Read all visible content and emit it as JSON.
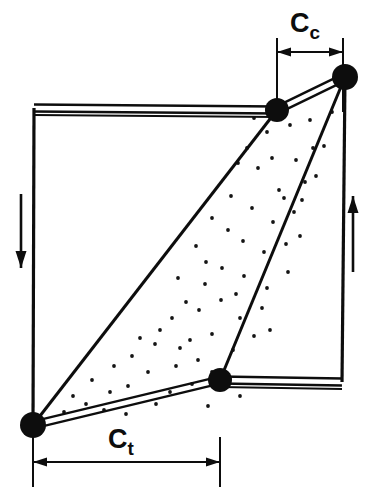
{
  "diagram": {
    "colors": {
      "ink": "#0d0d0d",
      "background": "#ffffff",
      "stipple": "#141414"
    },
    "labels": {
      "compression": {
        "base": "C",
        "subscript": "c",
        "full": "Cc"
      },
      "tension": {
        "base": "C",
        "subscript": "t",
        "full": "Ct"
      }
    },
    "dimensions": [
      {
        "name": "compression-width",
        "label_base": "C",
        "label_sub": "c",
        "x_start": 277,
        "x_end": 343,
        "line_y": 52,
        "ext_top": 38,
        "ext_bottom": 112,
        "label_x": 305,
        "label_y": 32
      },
      {
        "name": "tension-width",
        "label_base": "C",
        "label_sub": "t",
        "x_start": 33,
        "x_end": 220,
        "line_y": 462,
        "ext_top": 437,
        "ext_bottom": 487,
        "label_x": 121,
        "label_y": 448
      }
    ],
    "frame": {
      "name": "undeformed-frame",
      "top_left": {
        "x": 34,
        "y": 108
      },
      "top_right": {
        "x": 345,
        "y": 77
      },
      "bottom_right": {
        "x": 342,
        "y": 382
      },
      "bottom_left": {
        "x": 33,
        "y": 425
      },
      "stroke_width": 3
    },
    "nodes": [
      {
        "name": "node-top-left",
        "x": 277,
        "y": 110,
        "r": 12
      },
      {
        "name": "node-top-right",
        "x": 345,
        "y": 77,
        "r": 13
      },
      {
        "name": "node-bottom-right",
        "x": 220,
        "y": 380,
        "r": 12
      },
      {
        "name": "node-bottom-left",
        "x": 33,
        "y": 425,
        "r": 13
      }
    ],
    "chords": [
      {
        "name": "top-chord",
        "x1": 34,
        "y1": 108,
        "x2": 277,
        "y2": 110
      },
      {
        "name": "bottom-chord",
        "x1": 220,
        "y1": 380,
        "x2": 342,
        "y2": 382
      },
      {
        "name": "top-strut-link",
        "x1": 277,
        "y1": 110,
        "x2": 345,
        "y2": 77
      },
      {
        "name": "bottom-strut-link",
        "x1": 33,
        "y1": 425,
        "x2": 220,
        "y2": 380
      }
    ],
    "strut": {
      "name": "diagonal-strut-region",
      "points": "33,425 277,110 345,77 220,380",
      "fill_pattern": "stipple-dots"
    },
    "shear_arrows": [
      {
        "name": "shear-arrow-left",
        "direction": "down",
        "x": 21,
        "y_start": 194,
        "y_end": 268
      },
      {
        "name": "shear-arrow-right",
        "direction": "up",
        "x": 353,
        "y_start": 272,
        "y_end": 196
      }
    ],
    "stipple_dots": [
      [
        267,
        132
      ],
      [
        290,
        125
      ],
      [
        313,
        148
      ],
      [
        296,
        160
      ],
      [
        258,
        168
      ],
      [
        279,
        190
      ],
      [
        238,
        163
      ],
      [
        305,
        182
      ],
      [
        324,
        146
      ],
      [
        231,
        196
      ],
      [
        252,
        208
      ],
      [
        273,
        222
      ],
      [
        294,
        212
      ],
      [
        212,
        218
      ],
      [
        316,
        176
      ],
      [
        243,
        241
      ],
      [
        264,
        252
      ],
      [
        286,
        244
      ],
      [
        196,
        246
      ],
      [
        222,
        268
      ],
      [
        205,
        284
      ],
      [
        244,
        276
      ],
      [
        267,
        288
      ],
      [
        288,
        272
      ],
      [
        178,
        278
      ],
      [
        199,
        310
      ],
      [
        221,
        300
      ],
      [
        240,
        318
      ],
      [
        262,
        308
      ],
      [
        172,
        318
      ],
      [
        190,
        340
      ],
      [
        212,
        334
      ],
      [
        233,
        350
      ],
      [
        254,
        336
      ],
      [
        155,
        344
      ],
      [
        176,
        366
      ],
      [
        198,
        360
      ],
      [
        148,
        372
      ],
      [
        170,
        392
      ],
      [
        192,
        384
      ],
      [
        128,
        386
      ],
      [
        212,
        372
      ],
      [
        132,
        356
      ],
      [
        110,
        392
      ],
      [
        156,
        404
      ],
      [
        104,
        410
      ],
      [
        86,
        404
      ],
      [
        126,
        414
      ],
      [
        180,
        348
      ],
      [
        284,
        198
      ],
      [
        302,
        200
      ],
      [
        247,
        148
      ],
      [
        228,
        230
      ],
      [
        206,
        262
      ],
      [
        160,
        330
      ],
      [
        186,
        302
      ],
      [
        140,
        338
      ],
      [
        114,
        366
      ],
      [
        92,
        380
      ],
      [
        73,
        396
      ],
      [
        64,
        412
      ],
      [
        310,
        120
      ],
      [
        332,
        112
      ],
      [
        254,
        118
      ],
      [
        272,
        158
      ],
      [
        300,
        236
      ],
      [
        236,
        294
      ],
      [
        270,
        330
      ],
      [
        208,
        406
      ],
      [
        240,
        396
      ]
    ]
  }
}
